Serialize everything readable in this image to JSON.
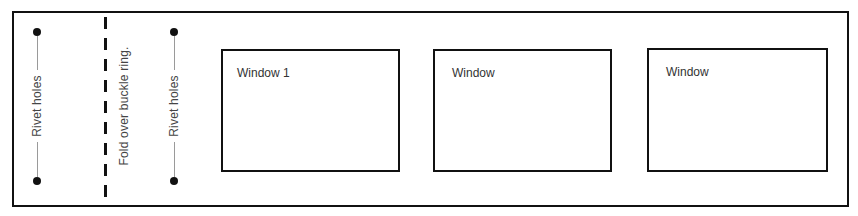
{
  "diagram": {
    "colors": {
      "stroke": "#111111",
      "guide_line": "#9a9a9a",
      "text": "#333333"
    },
    "rivet_groups": [
      {
        "label": "Rivet holes",
        "x": 37,
        "dots_y": [
          32,
          181
        ]
      },
      {
        "label": "Rivet holes",
        "x": 174,
        "dots_y": [
          32,
          181
        ]
      }
    ],
    "fold_line": {
      "label": "Fold over buckle ring.",
      "style": "dashed",
      "x": 105
    },
    "windows": [
      {
        "label": "Window 1"
      },
      {
        "label": "Window"
      },
      {
        "label": "Window"
      }
    ]
  }
}
